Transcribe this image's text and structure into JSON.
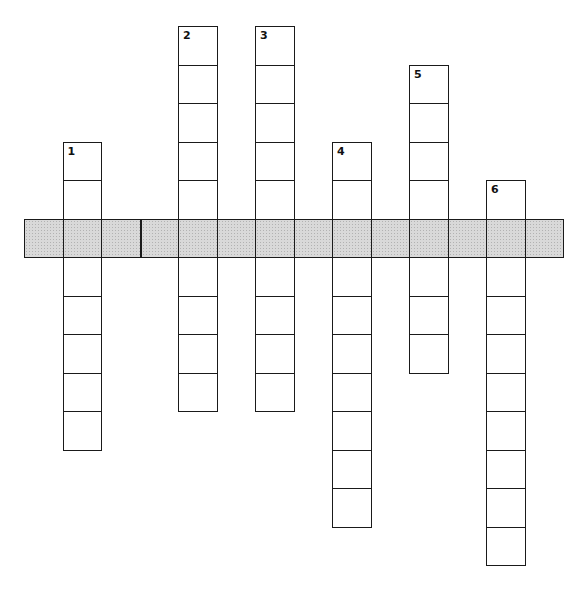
{
  "puzzle": {
    "type": "crossword",
    "cell_size": 38.5,
    "origin": {
      "x": 24,
      "y": 26
    },
    "shade_color": "#d9d9d9",
    "line_color": "#1a1a1a",
    "across": [
      {
        "id": "strip",
        "label": "",
        "row": 5,
        "start_col": 0,
        "length": 14,
        "shaded": true,
        "bold_divider_after_col": 2
      }
    ],
    "down": [
      {
        "number": "1",
        "col": 1,
        "start_row": 3,
        "length": 8
      },
      {
        "number": "2",
        "col": 4,
        "start_row": 0,
        "length": 10
      },
      {
        "number": "3",
        "col": 6,
        "start_row": 0,
        "length": 10
      },
      {
        "number": "4",
        "col": 8,
        "start_row": 3,
        "length": 10
      },
      {
        "number": "5",
        "col": 10,
        "start_row": 1,
        "length": 8
      },
      {
        "number": "6",
        "col": 12,
        "start_row": 4,
        "length": 10
      }
    ]
  }
}
